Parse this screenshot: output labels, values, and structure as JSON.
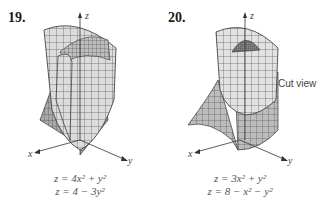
{
  "problems": [
    {
      "number": "19.",
      "equations": [
        "z = 4x² + y²",
        "z = 4 − 3y²"
      ],
      "axes": {
        "x": "x",
        "y": "y",
        "z": "z"
      }
    },
    {
      "number": "20.",
      "equations": [
        "z = 3x² + y²",
        "z = 8 − x² − y²"
      ],
      "axes": {
        "x": "x",
        "y": "y",
        "z": "z"
      },
      "annotation": "Cut view"
    }
  ],
  "colors": {
    "surface_light": "#e4e4e4",
    "surface_mid": "#c8c8c8",
    "surface_dark": "#9a9a9a",
    "grid": "#333333",
    "text": "#1a1a1a"
  }
}
